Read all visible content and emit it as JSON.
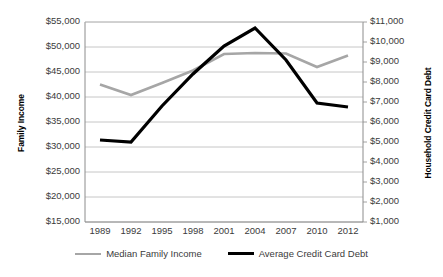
{
  "chart_data": {
    "type": "line",
    "title": "",
    "xlabel": "",
    "ylabel": "Family Income",
    "y2label": "Household Credit Card Debt",
    "grid": true,
    "legend_position": "bottom",
    "x": [
      "1989",
      "1992",
      "1995",
      "1998",
      "2001",
      "2004",
      "2007",
      "2010",
      "2012"
    ],
    "categories": [
      "1989",
      "1992",
      "1995",
      "1998",
      "2001",
      "2004",
      "2007",
      "2010",
      "2012"
    ],
    "ylim": [
      15000,
      55000
    ],
    "y2lim": [
      1000,
      11000
    ],
    "ytick_labels": [
      "$55,000",
      "$50,000",
      "$45,000",
      "$40,000",
      "$35,000",
      "$30,000",
      "$25,000",
      "$20,000",
      "$15,000"
    ],
    "ytick_values": [
      55000,
      50000,
      45000,
      40000,
      35000,
      30000,
      25000,
      20000,
      15000
    ],
    "y2tick_labels": [
      "$11,000",
      "$10,000",
      "$9,000",
      "$8,000",
      "$7,000",
      "$6,000",
      "$5,000",
      "$4,000",
      "$3,000",
      "$2,000",
      "$1,000"
    ],
    "y2tick_values": [
      11000,
      10000,
      9000,
      8000,
      7000,
      6000,
      5000,
      4000,
      3000,
      2000,
      1000
    ],
    "series": [
      {
        "name": "Median Family Income",
        "axis": "left",
        "color": "#a6a6a6",
        "width": 2.6,
        "values": [
          42500,
          40400,
          42800,
          45300,
          48600,
          48800,
          48700,
          46000,
          48300
        ]
      },
      {
        "name": "Average Credit Card Debt",
        "axis": "right",
        "color": "#000000",
        "width": 3.2,
        "values": [
          5100,
          5000,
          6800,
          8400,
          9800,
          10700,
          9100,
          6950,
          6750
        ]
      }
    ],
    "legend": [
      {
        "label": "Median Family Income",
        "color": "#a6a6a6",
        "width": 2.6
      },
      {
        "label": "Average Credit Card Debt",
        "color": "#000000",
        "width": 3.2
      }
    ]
  },
  "axes": {
    "left_title": "Family Income",
    "right_title": "Household Credit Card Debt"
  }
}
